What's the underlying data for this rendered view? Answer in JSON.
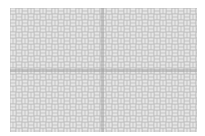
{
  "image": {
    "description": "Gray basket-weave line pattern tile with faint horizontal and vertical center bands",
    "width": 205,
    "height": 136,
    "pattern_area": {
      "x": 10,
      "y": 8,
      "width": 187,
      "height": 124
    },
    "tile_size": 12,
    "colors": {
      "background": "#ffffff",
      "line": "#bdbdbd",
      "band": "#9e9e9e"
    },
    "bands": {
      "vertical_x": 102,
      "horizontal_y": 70
    }
  }
}
